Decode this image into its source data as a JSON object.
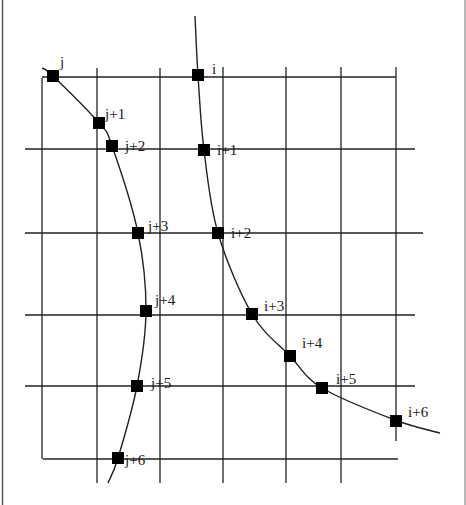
{
  "figure": {
    "type": "grid-curve-intersection-diagram",
    "colors": {
      "line": "#222222",
      "marker": "#000000",
      "border": "#555555",
      "background": "#ffffff"
    },
    "curves": [
      {
        "name": "curve-j",
        "points": [
          [
            42,
            68
          ],
          [
            53,
            76
          ],
          [
            99,
            123
          ],
          [
            112,
            146
          ],
          [
            138,
            233
          ],
          [
            146,
            311
          ],
          [
            137,
            386
          ],
          [
            118,
            458
          ],
          [
            108,
            483
          ]
        ]
      },
      {
        "name": "curve-i",
        "points": [
          [
            195,
            16
          ],
          [
            198,
            75
          ],
          [
            204,
            150
          ],
          [
            218,
            233
          ],
          [
            252,
            314
          ],
          [
            290,
            356
          ],
          [
            322,
            388
          ],
          [
            395,
            420
          ],
          [
            440,
            433
          ]
        ]
      }
    ],
    "markers": [
      {
        "id": "j",
        "label": "j",
        "x": 53,
        "y": 76,
        "lx": 60,
        "ly": 67
      },
      {
        "id": "j+1",
        "label": "j+1",
        "x": 99,
        "y": 123,
        "lx": 105,
        "ly": 119
      },
      {
        "id": "j+2",
        "label": "j+2",
        "x": 112,
        "y": 146,
        "lx": 125,
        "ly": 151
      },
      {
        "id": "j+3",
        "label": "j+3",
        "x": 138,
        "y": 233,
        "lx": 148,
        "ly": 231
      },
      {
        "id": "j+4",
        "label": "j+4",
        "x": 146,
        "y": 311,
        "lx": 155,
        "ly": 305
      },
      {
        "id": "j+5",
        "label": "j+5",
        "x": 137,
        "y": 386,
        "lx": 151,
        "ly": 388
      },
      {
        "id": "j+6",
        "label": "j+6",
        "x": 118,
        "y": 458,
        "lx": 125,
        "ly": 465
      },
      {
        "id": "i",
        "label": "i",
        "x": 198,
        "y": 75,
        "lx": 212,
        "ly": 74
      },
      {
        "id": "i+1",
        "label": "i+1",
        "x": 204,
        "y": 150,
        "lx": 217,
        "ly": 155
      },
      {
        "id": "i+2",
        "label": "i+2",
        "x": 218,
        "y": 233,
        "lx": 231,
        "ly": 238
      },
      {
        "id": "i+3",
        "label": "i+3",
        "x": 252,
        "y": 314,
        "lx": 264,
        "ly": 311
      },
      {
        "id": "i+4",
        "label": "i+4",
        "x": 290,
        "y": 356,
        "lx": 302,
        "ly": 348
      },
      {
        "id": "i+5",
        "label": "i+5",
        "x": 322,
        "y": 388,
        "lx": 336,
        "ly": 384
      },
      {
        "id": "i+6",
        "label": "i+6",
        "x": 396,
        "y": 421,
        "lx": 408,
        "ly": 417
      }
    ],
    "grid": {
      "vertical": [
        {
          "x": 42,
          "y1": 78,
          "y2": 459
        },
        {
          "x": 97,
          "y1": 68,
          "y2": 483
        },
        {
          "x": 160,
          "y1": 68,
          "y2": 483
        },
        {
          "x": 223,
          "y1": 67,
          "y2": 483
        },
        {
          "x": 286,
          "y1": 67,
          "y2": 483
        },
        {
          "x": 341,
          "y1": 67,
          "y2": 483
        },
        {
          "x": 396,
          "y1": 67,
          "y2": 441
        }
      ],
      "horizontal": [
        {
          "y": 77,
          "x1": 42,
          "x2": 396
        },
        {
          "y": 149,
          "x1": 25,
          "x2": 415
        },
        {
          "y": 233,
          "x1": 25,
          "x2": 423
        },
        {
          "y": 315,
          "x1": 25,
          "x2": 415
        },
        {
          "y": 386,
          "x1": 25,
          "x2": 415
        },
        {
          "y": 459,
          "x1": 43,
          "x2": 398
        }
      ]
    }
  }
}
